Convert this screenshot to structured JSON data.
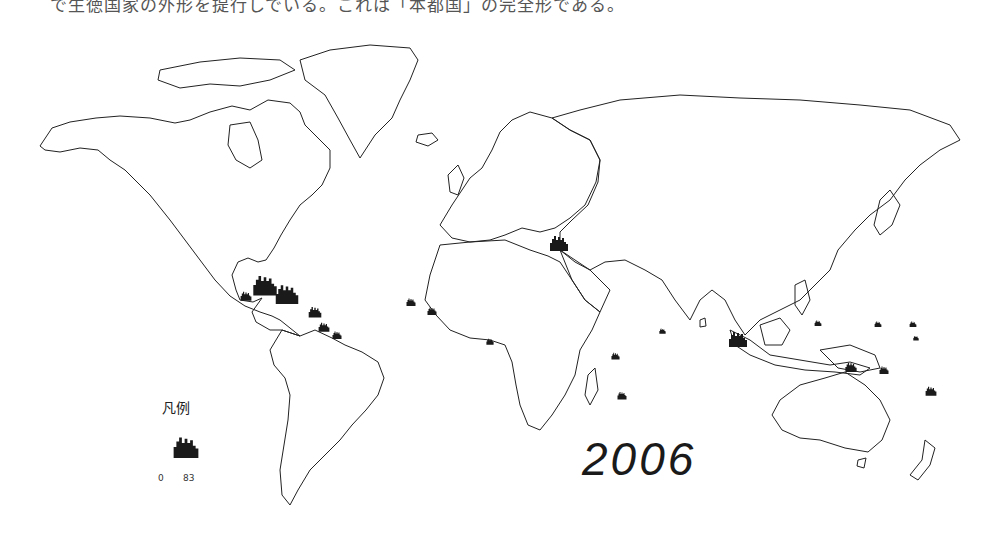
{
  "caption": "で生徳国家の外形を提行しでいる。これは「本都国」の完全形である。",
  "map": {
    "title_year": "2006",
    "projection": "world outline map (Miller-like)",
    "marker_color": "#1a1a1a",
    "outline_color": "#222222"
  },
  "legend": {
    "title": "凡例",
    "min_label": "0",
    "max_label": "83",
    "icon": "cluster-marker-icon"
  },
  "markers": [
    {
      "region": "Gulf of Mexico / Cuba",
      "x": 262,
      "y": 285,
      "size": "large"
    },
    {
      "region": "Caribbean (Greater Antilles)",
      "x": 290,
      "y": 295,
      "size": "medium"
    },
    {
      "region": "Yucatan",
      "x": 246,
      "y": 296,
      "size": "small"
    },
    {
      "region": "Lesser Antilles",
      "x": 315,
      "y": 312,
      "size": "medium"
    },
    {
      "region": "Trinidad / Venezuela coast",
      "x": 325,
      "y": 328,
      "size": "small"
    },
    {
      "region": "Guyana coast",
      "x": 337,
      "y": 336,
      "size": "small"
    },
    {
      "region": "Eastern Mediterranean",
      "x": 558,
      "y": 245,
      "size": "medium"
    },
    {
      "region": "Cape Verde",
      "x": 411,
      "y": 302,
      "size": "small"
    },
    {
      "region": "Senegal coast",
      "x": 432,
      "y": 311,
      "size": "small"
    },
    {
      "region": "Gulf of Guinea",
      "x": 490,
      "y": 342,
      "size": "small"
    },
    {
      "region": "Seychelles",
      "x": 615,
      "y": 356,
      "size": "small"
    },
    {
      "region": "Maldives",
      "x": 662,
      "y": 331,
      "size": "small"
    },
    {
      "region": "Mauritius",
      "x": 622,
      "y": 396,
      "size": "small"
    },
    {
      "region": "Sumatra / Malaysia",
      "x": 738,
      "y": 340,
      "size": "large"
    },
    {
      "region": "Micronesia (Palau)",
      "x": 818,
      "y": 323,
      "size": "small"
    },
    {
      "region": "Micronesia (east)",
      "x": 878,
      "y": 324,
      "size": "small"
    },
    {
      "region": "Marshall Islands",
      "x": 913,
      "y": 324,
      "size": "small"
    },
    {
      "region": "Nauru / Kiribati",
      "x": 916,
      "y": 338,
      "size": "small"
    },
    {
      "region": "Papua New Guinea",
      "x": 849,
      "y": 367,
      "size": "medium"
    },
    {
      "region": "Solomon Islands",
      "x": 883,
      "y": 370,
      "size": "small"
    },
    {
      "region": "Vanuatu / Fiji",
      "x": 930,
      "y": 390,
      "size": "medium"
    }
  ]
}
